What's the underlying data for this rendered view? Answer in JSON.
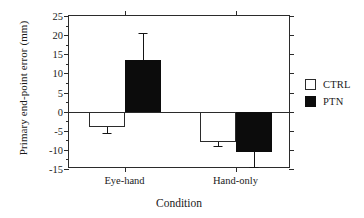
{
  "chart_data": {
    "type": "bar",
    "title": "",
    "xlabel": "Condition",
    "ylabel": "Primary end-point error (mm)",
    "categories": [
      "Eye-hand",
      "Hand-only"
    ],
    "ylim": [
      -15,
      25
    ],
    "yticks": [
      25,
      20,
      15,
      10,
      5,
      0,
      -5,
      -10,
      -15
    ],
    "ytick_labels": [
      "25",
      "20",
      "15",
      "10",
      "5",
      "0",
      "-5",
      "-10",
      "-15"
    ],
    "ytick_step": 5,
    "minor_ticks": true,
    "grid": false,
    "legend_position": "right",
    "zero_line": true,
    "series": [
      {
        "name": "CTRL",
        "color": "#ffffff",
        "edge_color": "#2b2b2b",
        "values": [
          -4.0,
          -8.0
        ],
        "errors": [
          1.5,
          1.0
        ]
      },
      {
        "name": "PTN",
        "color": "#0c0c0c",
        "edge_color": "#0c0c0c",
        "values": [
          13.5,
          -10.5
        ],
        "errors": [
          7.0,
          4.0
        ]
      }
    ]
  },
  "legend": {
    "items": [
      {
        "label": "CTRL",
        "swatch": "white-square"
      },
      {
        "label": "PTN",
        "swatch": "black-square"
      }
    ]
  },
  "axes": {
    "y_title": "Primary end-point error (mm)",
    "x_title": "Condition",
    "y_labels": [
      "25",
      "20",
      "15",
      "10",
      "5",
      "0",
      "-5",
      "-10",
      "-15"
    ],
    "x_labels": [
      "Eye-hand",
      "Hand-only"
    ]
  }
}
